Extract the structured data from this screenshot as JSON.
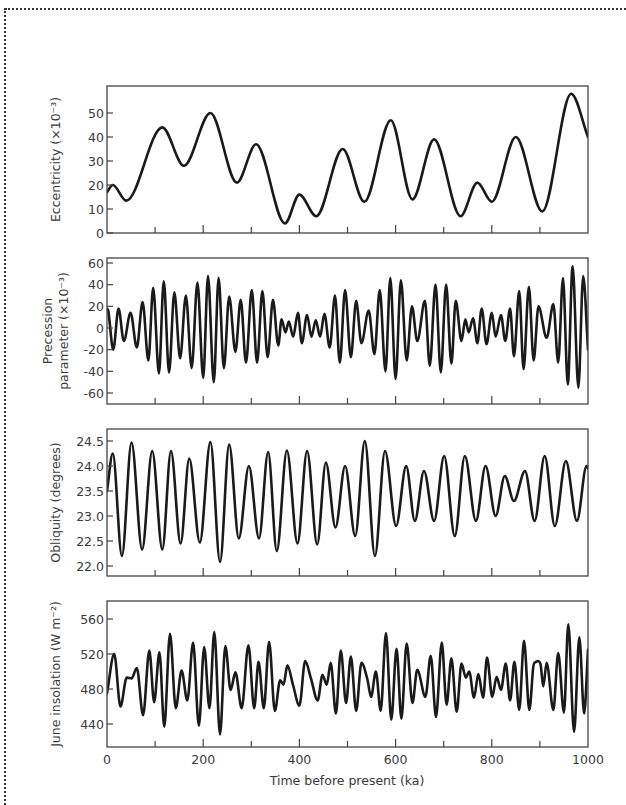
{
  "chart_data": {
    "type": "line",
    "title": "",
    "shared_x": {
      "label": "Time  before present (ka)",
      "range": [
        0,
        1000
      ],
      "ticks": [
        0,
        200,
        400,
        600,
        800,
        1000
      ],
      "minor_ticks": [
        100,
        300,
        500,
        700,
        900
      ]
    },
    "panels": [
      {
        "id": "eccentricity",
        "ylabel": [
          "Eccentricity (×10⁻³)"
        ],
        "ylim": [
          0,
          60
        ],
        "yticks": [
          0,
          10,
          20,
          30,
          40,
          50
        ],
        "ytick_labels": [
          "0",
          "10",
          "20",
          "30",
          "40",
          "50"
        ],
        "points": [
          [
            0,
            17
          ],
          [
            12,
            20
          ],
          [
            40,
            13.5
          ],
          [
            115,
            44
          ],
          [
            160,
            28
          ],
          [
            215,
            50
          ],
          [
            270,
            21
          ],
          [
            310,
            37
          ],
          [
            370,
            4
          ],
          [
            400,
            16
          ],
          [
            435,
            7
          ],
          [
            490,
            35
          ],
          [
            535,
            13
          ],
          [
            590,
            47
          ],
          [
            635,
            14
          ],
          [
            680,
            39
          ],
          [
            735,
            7
          ],
          [
            770,
            21
          ],
          [
            800,
            13
          ],
          [
            850,
            40
          ],
          [
            905,
            9
          ],
          [
            965,
            58
          ],
          [
            1000,
            40
          ]
        ]
      },
      {
        "id": "precession",
        "ylabel": [
          "Precession",
          "parameter (×10⁻³)"
        ],
        "ylim": [
          -72,
          64
        ],
        "yticks": [
          -60,
          -40,
          -20,
          0,
          20,
          40,
          60
        ],
        "ytick_labels": [
          "-60",
          "-40",
          "-20",
          "0",
          "20",
          "40",
          "60"
        ],
        "points": [
          [
            0,
            18
          ],
          [
            3,
            15
          ],
          [
            13,
            -20
          ],
          [
            24,
            18
          ],
          [
            35,
            -12
          ],
          [
            49,
            14
          ],
          [
            62,
            -18
          ],
          [
            74,
            24
          ],
          [
            86,
            -30
          ],
          [
            96,
            37
          ],
          [
            108,
            -42
          ],
          [
            118,
            43
          ],
          [
            129,
            -41
          ],
          [
            140,
            33
          ],
          [
            152,
            -28
          ],
          [
            164,
            30
          ],
          [
            176,
            -37
          ],
          [
            188,
            42
          ],
          [
            200,
            -46
          ],
          [
            210,
            48
          ],
          [
            222,
            -50
          ],
          [
            232,
            46
          ],
          [
            243,
            -37
          ],
          [
            254,
            29
          ],
          [
            267,
            -22
          ],
          [
            278,
            26
          ],
          [
            289,
            -32
          ],
          [
            301,
            35
          ],
          [
            312,
            -32
          ],
          [
            323,
            34
          ],
          [
            334,
            -27
          ],
          [
            345,
            26
          ],
          [
            356,
            -16
          ],
          [
            363,
            8
          ],
          [
            371,
            -4
          ],
          [
            378,
            6
          ],
          [
            387,
            -8
          ],
          [
            397,
            14
          ],
          [
            405,
            -14
          ],
          [
            416,
            12
          ],
          [
            425,
            -8
          ],
          [
            434,
            7
          ],
          [
            443,
            -8
          ],
          [
            452,
            13
          ],
          [
            463,
            -18
          ],
          [
            474,
            30
          ],
          [
            484,
            -32
          ],
          [
            495,
            35
          ],
          [
            507,
            -27
          ],
          [
            518,
            25
          ],
          [
            529,
            -14
          ],
          [
            544,
            16
          ],
          [
            556,
            -24
          ],
          [
            567,
            35
          ],
          [
            579,
            -40
          ],
          [
            589,
            46
          ],
          [
            600,
            -47
          ],
          [
            611,
            44
          ],
          [
            623,
            -30
          ],
          [
            634,
            20
          ],
          [
            645,
            -12
          ],
          [
            661,
            25
          ],
          [
            671,
            -35
          ],
          [
            683,
            40
          ],
          [
            694,
            -41
          ],
          [
            705,
            40
          ],
          [
            716,
            -33
          ],
          [
            725,
            25
          ],
          [
            737,
            -12
          ],
          [
            745,
            8
          ],
          [
            752,
            -4
          ],
          [
            761,
            9
          ],
          [
            770,
            -14
          ],
          [
            779,
            18
          ],
          [
            789,
            -15
          ],
          [
            800,
            14
          ],
          [
            808,
            -8
          ],
          [
            819,
            12
          ],
          [
            828,
            -12
          ],
          [
            838,
            18
          ],
          [
            846,
            -26
          ],
          [
            857,
            34
          ],
          [
            866,
            -38
          ],
          [
            877,
            38
          ],
          [
            887,
            -30
          ],
          [
            897,
            20
          ],
          [
            914,
            -9
          ],
          [
            928,
            22
          ],
          [
            938,
            -32
          ],
          [
            948,
            46
          ],
          [
            958,
            -52
          ],
          [
            968,
            57
          ],
          [
            980,
            -55
          ],
          [
            990,
            48
          ],
          [
            1000,
            -20
          ]
        ]
      },
      {
        "id": "obliquity",
        "ylabel": [
          "Obliquity (degrees)"
        ],
        "ylim": [
          21.85,
          24.78
        ],
        "yticks": [
          22.0,
          22.5,
          23.0,
          23.5,
          24.0,
          24.5
        ],
        "ytick_labels": [
          "22.0",
          "22.5",
          "23.0",
          "23.5",
          "24.0",
          "24.5"
        ],
        "points": [
          [
            0,
            23.5
          ],
          [
            12,
            24.25
          ],
          [
            31,
            22.2
          ],
          [
            51,
            24.47
          ],
          [
            73,
            22.33
          ],
          [
            94,
            24.3
          ],
          [
            115,
            22.33
          ],
          [
            133,
            24.3
          ],
          [
            153,
            22.45
          ],
          [
            171,
            24.15
          ],
          [
            193,
            22.47
          ],
          [
            215,
            24.48
          ],
          [
            235,
            22.08
          ],
          [
            254,
            24.43
          ],
          [
            274,
            22.55
          ],
          [
            295,
            24.0
          ],
          [
            316,
            22.55
          ],
          [
            335,
            24.28
          ],
          [
            353,
            22.3
          ],
          [
            374,
            24.31
          ],
          [
            396,
            22.45
          ],
          [
            416,
            24.3
          ],
          [
            437,
            22.43
          ],
          [
            455,
            24.07
          ],
          [
            475,
            22.77
          ],
          [
            495,
            24.0
          ],
          [
            516,
            22.6
          ],
          [
            536,
            24.5
          ],
          [
            557,
            22.2
          ],
          [
            578,
            24.3
          ],
          [
            601,
            22.8
          ],
          [
            622,
            24.0
          ],
          [
            640,
            22.9
          ],
          [
            659,
            23.9
          ],
          [
            680,
            22.9
          ],
          [
            701,
            24.2
          ],
          [
            723,
            22.6
          ],
          [
            744,
            24.2
          ],
          [
            767,
            22.9
          ],
          [
            787,
            24.0
          ],
          [
            808,
            23.0
          ],
          [
            827,
            23.8
          ],
          [
            846,
            23.3
          ],
          [
            869,
            23.9
          ],
          [
            889,
            22.9
          ],
          [
            910,
            24.2
          ],
          [
            931,
            22.8
          ],
          [
            954,
            24.1
          ],
          [
            977,
            22.9
          ],
          [
            997,
            24.0
          ],
          [
            1000,
            23.95
          ]
        ]
      },
      {
        "id": "june_insolation",
        "ylabel": [
          "June insolation (W m⁻²)"
        ],
        "ylim": [
          414,
          580
        ],
        "yticks": [
          440,
          480,
          520,
          560
        ],
        "ytick_labels": [
          "440",
          "480",
          "520",
          "560"
        ],
        "points": [
          [
            0,
            475
          ],
          [
            15,
            520
          ],
          [
            28,
            460
          ],
          [
            41,
            493
          ],
          [
            51,
            492
          ],
          [
            62,
            504
          ],
          [
            75,
            450
          ],
          [
            88,
            524
          ],
          [
            98,
            465
          ],
          [
            109,
            522
          ],
          [
            119,
            437
          ],
          [
            131,
            543
          ],
          [
            143,
            458
          ],
          [
            155,
            501
          ],
          [
            167,
            467
          ],
          [
            179,
            533
          ],
          [
            191,
            438
          ],
          [
            202,
            528
          ],
          [
            213,
            458
          ],
          [
            223,
            545
          ],
          [
            235,
            428
          ],
          [
            246,
            529
          ],
          [
            257,
            479
          ],
          [
            267,
            499
          ],
          [
            280,
            458
          ],
          [
            294,
            530
          ],
          [
            306,
            458
          ],
          [
            315,
            511
          ],
          [
            326,
            458
          ],
          [
            337,
            534
          ],
          [
            349,
            455
          ],
          [
            360,
            490
          ],
          [
            367,
            485
          ],
          [
            375,
            507
          ],
          [
            387,
            484
          ],
          [
            400,
            461
          ],
          [
            412,
            512
          ],
          [
            424,
            492
          ],
          [
            438,
            467
          ],
          [
            448,
            496
          ],
          [
            457,
            485
          ],
          [
            465,
            510
          ],
          [
            476,
            452
          ],
          [
            486,
            524
          ],
          [
            497,
            464
          ],
          [
            507,
            517
          ],
          [
            518,
            455
          ],
          [
            529,
            510
          ],
          [
            541,
            492
          ],
          [
            549,
            471
          ],
          [
            559,
            500
          ],
          [
            569,
            455
          ],
          [
            580,
            544
          ],
          [
            591,
            445
          ],
          [
            602,
            526
          ],
          [
            612,
            446
          ],
          [
            623,
            532
          ],
          [
            635,
            464
          ],
          [
            645,
            502
          ],
          [
            662,
            471
          ],
          [
            673,
            518
          ],
          [
            684,
            448
          ],
          [
            696,
            533
          ],
          [
            706,
            462
          ],
          [
            716,
            515
          ],
          [
            727,
            454
          ],
          [
            737,
            509
          ],
          [
            746,
            493
          ],
          [
            753,
            500
          ],
          [
            763,
            470
          ],
          [
            772,
            497
          ],
          [
            782,
            470
          ],
          [
            790,
            516
          ],
          [
            801,
            471
          ],
          [
            810,
            494
          ],
          [
            819,
            479
          ],
          [
            829,
            509
          ],
          [
            838,
            467
          ],
          [
            847,
            511
          ],
          [
            857,
            456
          ],
          [
            867,
            535
          ],
          [
            878,
            456
          ],
          [
            888,
            510
          ],
          [
            901,
            509
          ],
          [
            907,
            483
          ],
          [
            914,
            510
          ],
          [
            928,
            456
          ],
          [
            938,
            521
          ],
          [
            950,
            453
          ],
          [
            959,
            554
          ],
          [
            971,
            431
          ],
          [
            982,
            539
          ],
          [
            992,
            452
          ],
          [
            1000,
            525
          ]
        ]
      }
    ],
    "grid": false,
    "legend": null
  },
  "colors": {
    "line": "#1a1a1a",
    "axis": "#444444",
    "text": "#3a3a3a",
    "background": "#ffffff"
  }
}
